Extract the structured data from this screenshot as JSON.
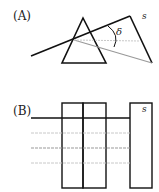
{
  "panelA": {
    "label": "(A)",
    "screen_label": "s",
    "angle_label": "δ"
  },
  "panelB": {
    "label": "(B)",
    "screen_label": "s"
  },
  "colors": {
    "line": "#111111",
    "ray_gray": "#9a9a9a",
    "ray_light": "#c8c8c8"
  }
}
